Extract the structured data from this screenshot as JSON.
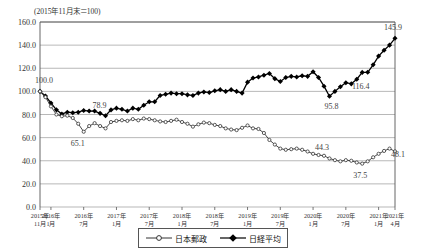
{
  "header": {
    "unit_note": "(2015年11月末＝100)"
  },
  "legend": {
    "position": "bottom-center",
    "items": [
      {
        "label": "日本郵政",
        "marker": "open-circle",
        "color": "#222222"
      },
      {
        "label": "日経平均",
        "marker": "filled-diamond",
        "color": "#000000"
      }
    ]
  },
  "chart_data": {
    "type": "line",
    "title": "",
    "subtitle": "",
    "xlabel": "",
    "ylabel": "",
    "ylim": [
      0.0,
      160.0
    ],
    "yticks": [
      "0.0",
      "20.0",
      "40.0",
      "60.0",
      "80.0",
      "100.0",
      "120.0",
      "140.0",
      "160.0"
    ],
    "ytick_values": [
      0,
      20,
      40,
      60,
      80,
      100,
      120,
      140,
      160
    ],
    "grid": true,
    "legend": "bottom",
    "xticks": [
      {
        "top": "2015年",
        "bottom": "11月",
        "index": 0
      },
      {
        "top": "2016年",
        "bottom": "1月",
        "index": 2
      },
      {
        "top": "2016年",
        "bottom": "7月",
        "index": 8
      },
      {
        "top": "2017年",
        "bottom": "1月",
        "index": 14
      },
      {
        "top": "2017年",
        "bottom": "7月",
        "index": 20
      },
      {
        "top": "2018年",
        "bottom": "1月",
        "index": 26
      },
      {
        "top": "2018年",
        "bottom": "7月",
        "index": 32
      },
      {
        "top": "2019年",
        "bottom": "1月",
        "index": 38
      },
      {
        "top": "2019年",
        "bottom": "7月",
        "index": 44
      },
      {
        "top": "2020年",
        "bottom": "1月",
        "index": 50
      },
      {
        "top": "2020年",
        "bottom": "7月",
        "index": 56
      },
      {
        "top": "2021年",
        "bottom": "1月",
        "index": 62
      },
      {
        "top": "2021年",
        "bottom": "4月",
        "index": 65
      }
    ],
    "n_points": 66,
    "annotations": [
      {
        "text": "100.0",
        "series": "日経平均",
        "index": 0,
        "dx": 4,
        "dy": -8
      },
      {
        "text": "78.9",
        "series": "日経平均",
        "index": 12,
        "dx": -6,
        "dy": -8
      },
      {
        "text": "65.1",
        "series": "日本郵政",
        "index": 8,
        "dx": -6,
        "dy": 14
      },
      {
        "text": "95.8",
        "series": "日経平均",
        "index": 53,
        "dx": 2,
        "dy": 13
      },
      {
        "text": "116.4",
        "series": "日経平均",
        "index": 58,
        "dx": 4,
        "dy": 10
      },
      {
        "text": "145.9",
        "series": "日経平均",
        "index": 65,
        "dx": -2,
        "dy": -8
      },
      {
        "text": "44.3",
        "series": "日本郵政",
        "index": 52,
        "dx": -2,
        "dy": -6
      },
      {
        "text": "37.5",
        "series": "日本郵政",
        "index": 59,
        "dx": -2,
        "dy": 14
      },
      {
        "text": "48.1",
        "series": "日本郵政",
        "index": 65,
        "dx": 3,
        "dy": 6
      }
    ],
    "series": [
      {
        "name": "日経平均",
        "marker": "filled-diamond",
        "color": "#000000",
        "values": [
          100.0,
          96.0,
          90.0,
          84.0,
          80.5,
          82.0,
          81.5,
          82.0,
          83.5,
          83.0,
          83.0,
          81.0,
          78.9,
          84.0,
          85.5,
          84.5,
          83.0,
          85.5,
          84.5,
          88.0,
          91.0,
          91.0,
          96.5,
          97.5,
          98.5,
          98.0,
          98.0,
          97.0,
          96.5,
          98.5,
          99.5,
          99.0,
          100.5,
          101.5,
          100.0,
          101.5,
          100.0,
          98.5,
          108.0,
          111.5,
          112.5,
          114.0,
          115.5,
          111.0,
          108.5,
          112.0,
          113.0,
          112.5,
          113.5,
          113.0,
          117.0,
          112.0,
          104.5,
          95.8,
          100.0,
          104.0,
          107.5,
          106.5,
          110.5,
          116.4,
          116.5,
          123.0,
          130.5,
          135.5,
          140.0,
          145.9
        ]
      },
      {
        "name": "日本郵政",
        "marker": "open-circle",
        "color": "#333333",
        "values": [
          100.0,
          95.0,
          87.0,
          80.0,
          78.5,
          79.0,
          77.0,
          72.0,
          65.1,
          70.0,
          72.5,
          70.0,
          68.0,
          73.5,
          74.5,
          75.0,
          74.5,
          76.0,
          75.0,
          76.5,
          76.0,
          75.0,
          74.0,
          73.5,
          74.5,
          75.5,
          73.5,
          72.0,
          69.5,
          71.5,
          73.0,
          72.5,
          71.0,
          70.0,
          68.0,
          67.0,
          66.5,
          68.5,
          70.5,
          68.0,
          67.5,
          64.0,
          58.0,
          54.0,
          50.5,
          49.5,
          50.0,
          50.5,
          49.5,
          48.0,
          46.0,
          45.0,
          44.3,
          42.0,
          40.5,
          39.5,
          40.5,
          40.0,
          38.5,
          37.5,
          39.5,
          43.0,
          46.0,
          48.5,
          50.5,
          48.1
        ]
      }
    ]
  }
}
